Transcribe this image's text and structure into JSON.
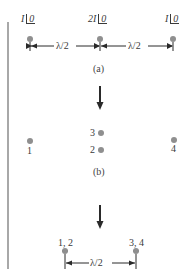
{
  "figure": {
    "panel_a": {
      "caption": "(a)",
      "elements": [
        {
          "id": "left",
          "amplitude": "I",
          "phase": "0"
        },
        {
          "id": "center",
          "amplitude": "2I",
          "phase": "0"
        },
        {
          "id": "right",
          "amplitude": "I",
          "phase": "0"
        }
      ],
      "spacings": [
        "λ/2",
        "λ/2"
      ]
    },
    "panel_b": {
      "caption": "(b)",
      "elements": [
        {
          "id": "1",
          "label": "1"
        },
        {
          "id": "2",
          "label": "2"
        },
        {
          "id": "3",
          "label": "3"
        },
        {
          "id": "4",
          "label": "4"
        }
      ]
    },
    "panel_c": {
      "elements": [
        {
          "id": "12",
          "label": "1, 2"
        },
        {
          "id": "34",
          "label": "3, 4"
        }
      ],
      "spacing": "λ/2"
    },
    "colors": {
      "dot": "#8f8f8f",
      "line": "#3a3a3a",
      "border": "#a8a8a8"
    }
  }
}
